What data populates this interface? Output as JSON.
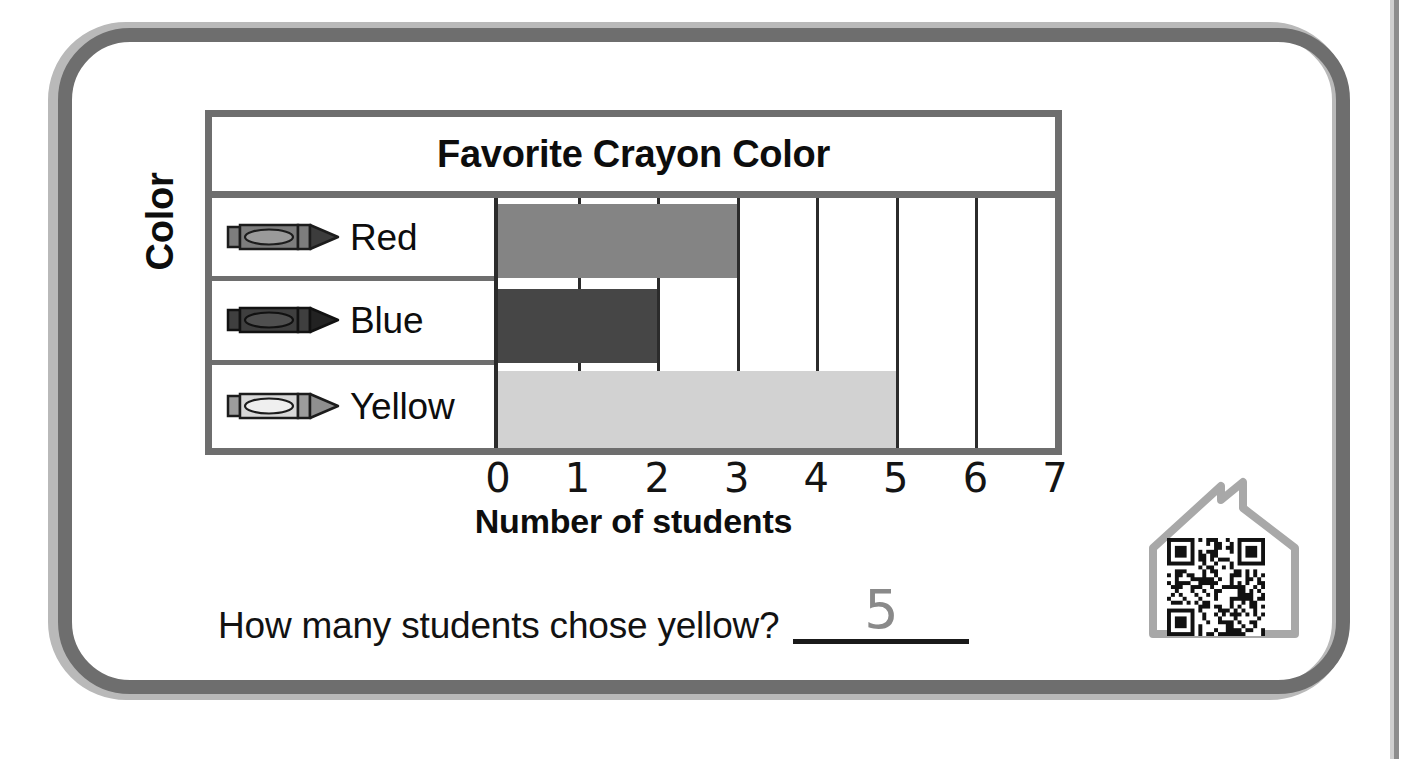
{
  "worksheet": {
    "question": "How many students chose yellow?",
    "answer": "5",
    "y_axis_title": "Color"
  },
  "icons": {
    "house_qr": "house-qr-icon",
    "crayon": "crayon-icon"
  },
  "chart_data": {
    "type": "bar",
    "orientation": "horizontal",
    "title": "Favorite Crayon Color",
    "xlabel": "Number of students",
    "ylabel": "Color",
    "categories": [
      "Red",
      "Blue",
      "Yellow"
    ],
    "values": [
      3,
      2,
      5
    ],
    "xlim": [
      0,
      7
    ],
    "xticks": [
      "0",
      "1",
      "2",
      "3",
      "4",
      "5",
      "6",
      "7"
    ],
    "grid": true,
    "legend": false,
    "bar_colors": [
      "#848484",
      "#464646",
      "#d2d2d2"
    ],
    "crayon_colors": [
      "#7d7d7d",
      "#3f3f3f",
      "#d8d8d8"
    ]
  }
}
